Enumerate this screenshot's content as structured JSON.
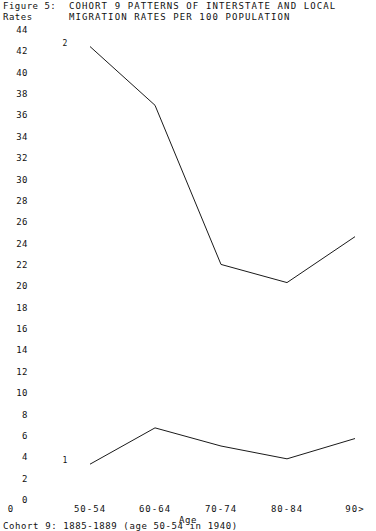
{
  "figure": {
    "label": "Figure 5:",
    "title_line1": "COHORT 9 PATTERNS OF INTERSTATE AND LOCAL",
    "title_line2": "MIGRATION RATES PER 100 POPULATION",
    "y_axis_title": "Rates",
    "caption": "Cohort 9: 1885-1889 (age 50-54 in 1940)"
  },
  "chart_data": {
    "type": "line",
    "title": "COHORT 9 PATTERNS OF INTERSTATE AND LOCAL MIGRATION RATES PER 100 POPULATION",
    "xlabel": "Age",
    "ylabel": "Rates",
    "categories": [
      "50-54",
      "60-64",
      "70-74",
      "80-84",
      "90>"
    ],
    "ylim": [
      0,
      44
    ],
    "ytick_step": 2,
    "yticks": [
      0,
      2,
      4,
      6,
      8,
      10,
      12,
      14,
      16,
      18,
      20,
      22,
      24,
      26,
      28,
      30,
      32,
      34,
      36,
      38,
      40,
      42,
      44
    ],
    "origin_tick_label": "0",
    "grid": false,
    "legend_position": "inline-point-labels",
    "series": [
      {
        "name": "2",
        "label": "2",
        "description": "Interstate migration rate per 100 population",
        "values": [
          42.5,
          37.0,
          22.1,
          20.4,
          24.7
        ],
        "color": "#1a1a1a"
      },
      {
        "name": "1",
        "label": "1",
        "description": "Local migration rate per 100 population",
        "values": [
          3.4,
          6.8,
          5.1,
          3.9,
          5.8
        ],
        "color": "#1a1a1a"
      }
    ]
  }
}
